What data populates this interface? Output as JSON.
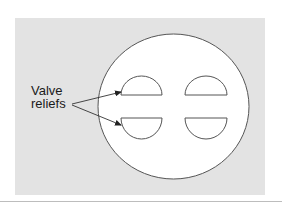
{
  "figure": {
    "background_color": "#e3e3e3",
    "piston_fill": "#ffffff",
    "stroke_color": "#555555",
    "label": {
      "line1": "Valve",
      "line2": "reliefs"
    },
    "shapes": {
      "piston_crown": {
        "cx": 173.5,
        "cy": 106.5,
        "rx": 75.5,
        "ry": 72.5
      },
      "valve_reliefs": [
        {
          "position": "top-left",
          "x1": 121,
          "x2": 162,
          "flat_y": 95,
          "arc_extent_y": 76
        },
        {
          "position": "top-right",
          "x1": 185,
          "x2": 227,
          "flat_y": 95,
          "arc_extent_y": 76
        },
        {
          "position": "bottom-left",
          "x1": 121,
          "x2": 162,
          "flat_y": 118,
          "arc_extent_y": 139
        },
        {
          "position": "bottom-right",
          "x1": 185,
          "x2": 227,
          "flat_y": 118,
          "arc_extent_y": 139
        }
      ]
    }
  }
}
